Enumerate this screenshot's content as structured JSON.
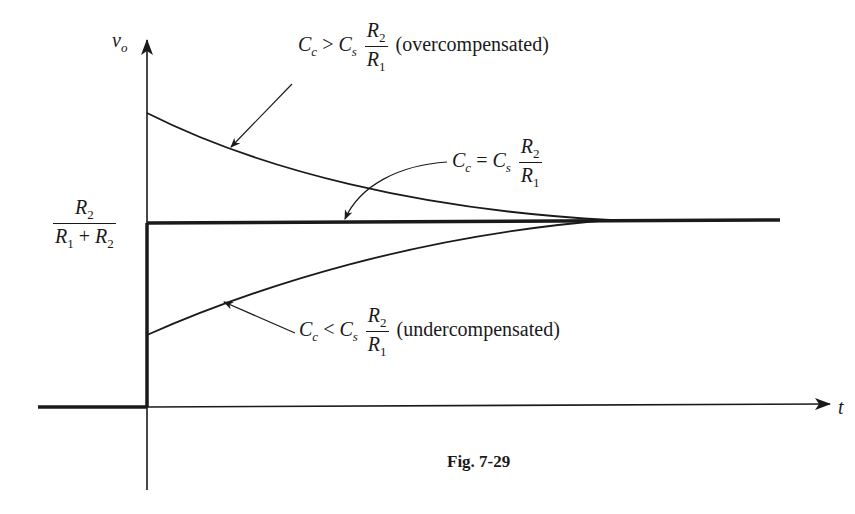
{
  "figure": {
    "caption": "Fig. 7-29",
    "y_axis_label_main": "v",
    "y_axis_label_sub": "o",
    "x_axis_label": "t",
    "final_value": {
      "numerator_main": "R",
      "numerator_sub": "2",
      "denominator_a_main": "R",
      "denominator_a_sub": "1",
      "plus": "+",
      "denominator_b_main": "R",
      "denominator_b_sub": "2"
    },
    "curves": {
      "over": {
        "lhs_main": "C",
        "lhs_sub": "c",
        "relation": ">",
        "rhs_main": "C",
        "rhs_sub": "s",
        "frac_num_main": "R",
        "frac_num_sub": "2",
        "frac_den_main": "R",
        "frac_den_sub": "1",
        "note": "(overcompensated)"
      },
      "exact": {
        "lhs_main": "C",
        "lhs_sub": "c",
        "relation": "=",
        "rhs_main": "C",
        "rhs_sub": "s",
        "frac_num_main": "R",
        "frac_num_sub": "2",
        "frac_den_main": "R",
        "frac_den_sub": "1"
      },
      "under": {
        "lhs_main": "C",
        "lhs_sub": "c",
        "relation": "<",
        "rhs_main": "C",
        "rhs_sub": "s",
        "frac_num_main": "R",
        "frac_num_sub": "2",
        "frac_den_main": "R",
        "frac_den_sub": "1",
        "note": "(undercompensated)"
      }
    },
    "colors": {
      "ink": "#1a1a1a",
      "background": "#ffffff"
    }
  }
}
